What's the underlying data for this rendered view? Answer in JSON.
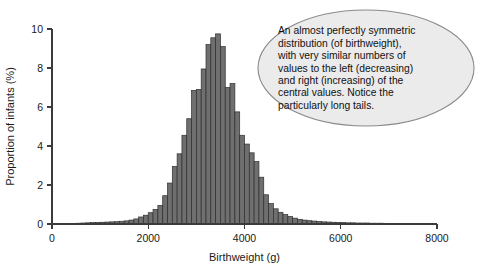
{
  "figure": {
    "background_color": "#ffffff",
    "bar_fill_color": "#6f6f6f",
    "bar_edge_color": "#2e2e2e",
    "callout_fill_color": "#ebebeb",
    "callout_border_color": "#8a8a8a",
    "axis_color": "#3b3b3b"
  },
  "annotation": {
    "name": "callout-bubble",
    "lines": [
      "An almost perfectly symmetric",
      "distribution (of birthweight),",
      "with very similar numbers of",
      "values to the left (decreasing)",
      "and right (increasing) of the",
      "central values. Notice the",
      "particularly long tails."
    ],
    "text": "An almost perfectly symmetric distribution (of birthweight), with very similar numbers of values to the left (decreasing) and right (increasing) of the central values. Notice the particularly long tails."
  },
  "chart_data": {
    "type": "bar",
    "title": "",
    "subtitle": "",
    "xlabel": "Birthweight (g)",
    "ylabel": "Proportion of infants (%)",
    "xlim": [
      0,
      8000
    ],
    "ylim": [
      0,
      10
    ],
    "xticks": [
      0,
      2000,
      4000,
      6000,
      8000
    ],
    "xtick_labels": [
      "0",
      "2000",
      "4000",
      "6000",
      "8000"
    ],
    "yticks": [
      0,
      2,
      4,
      6,
      8,
      10
    ],
    "ytick_labels": [
      "0",
      "2",
      "4",
      "6",
      "8",
      "10"
    ],
    "grid": false,
    "legend": null,
    "bin_width": 100,
    "categories": [
      400,
      500,
      600,
      700,
      800,
      900,
      1000,
      1100,
      1200,
      1300,
      1400,
      1500,
      1600,
      1700,
      1800,
      1900,
      2000,
      2100,
      2200,
      2300,
      2400,
      2500,
      2600,
      2700,
      2800,
      2900,
      3000,
      3100,
      3200,
      3300,
      3400,
      3500,
      3600,
      3700,
      3800,
      3900,
      4000,
      4100,
      4200,
      4300,
      4400,
      4500,
      4600,
      4700,
      4800,
      4900,
      5000,
      5100,
      5200,
      5300,
      5400,
      5500,
      5600,
      5700,
      5800,
      5900,
      6000,
      6100,
      6200,
      6300,
      6400,
      6500,
      6600,
      6700,
      6800,
      6900,
      7000
    ],
    "values": [
      0.03,
      0.04,
      0.05,
      0.06,
      0.07,
      0.08,
      0.09,
      0.1,
      0.11,
      0.12,
      0.14,
      0.16,
      0.2,
      0.26,
      0.36,
      0.45,
      0.58,
      0.75,
      0.95,
      1.45,
      2.1,
      2.95,
      3.6,
      4.55,
      5.4,
      6.85,
      6.9,
      7.95,
      9.2,
      9.55,
      9.75,
      9.1,
      7.0,
      7.2,
      5.75,
      4.55,
      4.1,
      3.65,
      3.2,
      2.4,
      1.5,
      1.05,
      0.78,
      0.6,
      0.48,
      0.38,
      0.3,
      0.24,
      0.2,
      0.17,
      0.15,
      0.13,
      0.11,
      0.1,
      0.09,
      0.08,
      0.07,
      0.06,
      0.06,
      0.05,
      0.05,
      0.05,
      0.04,
      0.04,
      0.04,
      0.03,
      0.03
    ]
  }
}
